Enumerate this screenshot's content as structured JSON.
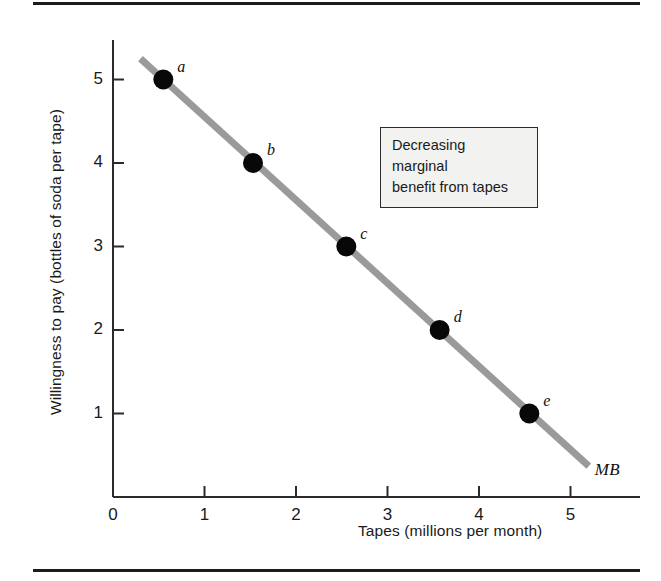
{
  "chart_data": {
    "type": "line",
    "title": "",
    "xlabel": "Tapes (millions per month)",
    "ylabel": "Willingness to pay (bottles of soda per tape)",
    "xlim": [
      0,
      5.8
    ],
    "ylim": [
      0,
      5.6
    ],
    "xticks": [
      0,
      1,
      2,
      3,
      4,
      5
    ],
    "xtick_labels": [
      "0",
      "1",
      "2",
      "3",
      "4",
      "5"
    ],
    "yticks": [
      1,
      2,
      3,
      4,
      5
    ],
    "ytick_labels": [
      "1",
      "2",
      "3",
      "4",
      "5"
    ],
    "grid": false,
    "legend_position": "none",
    "series": [
      {
        "name": "MB",
        "label": "MB",
        "color": "#9a9a9a",
        "line_from": [
          0.3,
          5.25
        ],
        "line_to": [
          5.2,
          0.37
        ],
        "points": [
          {
            "label": "a",
            "x": 0.55,
            "y": 5
          },
          {
            "label": "b",
            "x": 1.53,
            "y": 4
          },
          {
            "label": "c",
            "x": 2.55,
            "y": 3
          },
          {
            "label": "d",
            "x": 3.57,
            "y": 2
          },
          {
            "label": "e",
            "x": 4.55,
            "y": 1
          }
        ]
      }
    ],
    "annotations": [
      {
        "name": "decreasing-marginal-benefit-note",
        "lines": [
          "Decreasing",
          "marginal",
          "benefit from tapes"
        ]
      }
    ]
  },
  "colors": {
    "curve": "#9a9a9a",
    "axis": "#2b2b2b",
    "point": "#080808",
    "text": "#1a1a1a",
    "box_fill": "#f2f2f0",
    "box_border": "#2b2b2b",
    "rule": "#1c1c1c"
  }
}
